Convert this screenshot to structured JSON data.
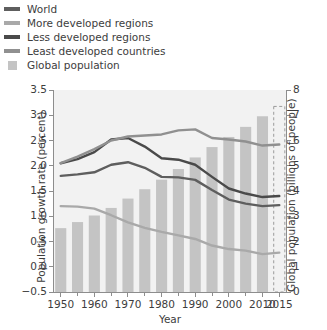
{
  "chart_data": {
    "type": "line",
    "title": "",
    "xlabel": "Year",
    "ylabel": "Population growth rate (percent)",
    "ylabel_right": "Global population (billions of people)",
    "xlim": [
      1948,
      2017
    ],
    "ylim": [
      -0.5,
      3.5
    ],
    "ylim_right": [
      0,
      8
    ],
    "yticks": [
      "3.5",
      "3.0",
      "2.5",
      "2.0",
      "1.5",
      "1.0",
      "0.5",
      "0.0",
      "−0.5"
    ],
    "ytick_values": [
      3.5,
      3.0,
      2.5,
      2.0,
      1.5,
      1.0,
      0.5,
      0.0,
      -0.5
    ],
    "yticks_right": [
      "8",
      "7",
      "6",
      "5",
      "4",
      "3",
      "2",
      "1",
      "0"
    ],
    "ytick_values_right": [
      8,
      7,
      6,
      5,
      4,
      3,
      2,
      1,
      0
    ],
    "xticks": [
      "1950",
      "1960",
      "1970",
      "1980",
      "1990",
      "2000",
      "2010",
      "2015"
    ],
    "xtick_values": [
      1950,
      1960,
      1970,
      1980,
      1990,
      2000,
      2010,
      2015
    ],
    "xtick_minor": [
      1955,
      1965,
      1975,
      1985,
      1995,
      2005
    ],
    "grid": false,
    "legend_position": "above-plot",
    "plot_background": "#f2f2f2",
    "bars": {
      "name": "Global population",
      "axis": "right",
      "unit": "billions of people",
      "color": "#c4c4c4",
      "projected_color": "#f2f2f2",
      "projected_border": "#9a9a9a",
      "x": [
        1950,
        1955,
        1960,
        1965,
        1970,
        1975,
        1980,
        1985,
        1990,
        1995,
        2000,
        2005,
        2010,
        2015
      ],
      "values": [
        2.53,
        2.77,
        3.03,
        3.33,
        3.7,
        4.07,
        4.45,
        4.87,
        5.33,
        5.74,
        6.14,
        6.54,
        6.96,
        7.35
      ],
      "projected_index": 13
    },
    "series": [
      {
        "name": "World",
        "color": "#5e5e5e",
        "axis": "left",
        "x": [
          1950,
          1955,
          1960,
          1965,
          1970,
          1975,
          1980,
          1985,
          1990,
          1995,
          2000,
          2005,
          2010,
          2015
        ],
        "values": [
          1.8,
          1.83,
          1.87,
          2.02,
          2.07,
          1.96,
          1.78,
          1.77,
          1.72,
          1.52,
          1.33,
          1.25,
          1.2,
          1.22
        ]
      },
      {
        "name": "More developed regions",
        "color": "#a9a9a9",
        "axis": "left",
        "x": [
          1950,
          1955,
          1960,
          1965,
          1970,
          1975,
          1980,
          1985,
          1990,
          1995,
          2000,
          2005,
          2010,
          2015
        ],
        "values": [
          1.2,
          1.19,
          1.15,
          1.02,
          0.88,
          0.77,
          0.69,
          0.62,
          0.55,
          0.42,
          0.35,
          0.32,
          0.25,
          0.28
        ]
      },
      {
        "name": "Less developed regions",
        "color": "#4a4a4a",
        "axis": "left",
        "x": [
          1950,
          1955,
          1960,
          1965,
          1970,
          1975,
          1980,
          1985,
          1990,
          1995,
          2000,
          2005,
          2010,
          2015
        ],
        "values": [
          2.05,
          2.13,
          2.27,
          2.52,
          2.55,
          2.38,
          2.15,
          2.12,
          2.02,
          1.78,
          1.55,
          1.45,
          1.38,
          1.4
        ]
      },
      {
        "name": "Least developed countries",
        "color": "#909090",
        "axis": "left",
        "x": [
          1950,
          1955,
          1960,
          1965,
          1970,
          1975,
          1980,
          1985,
          1990,
          1995,
          2000,
          2005,
          2010,
          2015
        ],
        "values": [
          2.05,
          2.18,
          2.33,
          2.5,
          2.58,
          2.6,
          2.62,
          2.7,
          2.72,
          2.55,
          2.52,
          2.48,
          2.4,
          2.42
        ]
      }
    ]
  },
  "legend": {
    "items": [
      {
        "label": "World",
        "color": "#5e5e5e",
        "marker": "line"
      },
      {
        "label": "More developed regions",
        "color": "#a9a9a9",
        "marker": "line"
      },
      {
        "label": "Less developed regions",
        "color": "#4a4a4a",
        "marker": "line"
      },
      {
        "label": "Least developed countries",
        "color": "#909090",
        "marker": "line"
      },
      {
        "label": "Global population",
        "color": "#c4c4c4",
        "marker": "area"
      }
    ]
  }
}
